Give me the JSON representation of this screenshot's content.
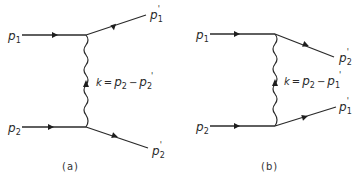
{
  "diagrams": [
    {
      "id": "a",
      "caption": "(a)",
      "incoming_top": {
        "symbol": "p",
        "sub": "1",
        "prime": ""
      },
      "incoming_bottom": {
        "symbol": "p",
        "sub": "2",
        "prime": ""
      },
      "outgoing_top": {
        "symbol": "p",
        "sub": "1",
        "prime": "'"
      },
      "outgoing_bottom": {
        "symbol": "p",
        "sub": "2",
        "prime": "'"
      },
      "exchange": {
        "k": "k",
        "eq": "=",
        "p": "p",
        "s1": "2",
        "minus": "−",
        "p2": "p",
        "s2": "2",
        "prime": "'"
      }
    },
    {
      "id": "b",
      "caption": "(b)",
      "incoming_top": {
        "symbol": "p",
        "sub": "1",
        "prime": ""
      },
      "incoming_bottom": {
        "symbol": "p",
        "sub": "2",
        "prime": ""
      },
      "outgoing_top": {
        "symbol": "p",
        "sub": "2",
        "prime": "'"
      },
      "outgoing_bottom": {
        "symbol": "p",
        "sub": "1",
        "prime": "'"
      },
      "exchange": {
        "k": "k",
        "eq": "=",
        "p": "p",
        "s1": "2",
        "minus": "−",
        "p2": "p",
        "s2": "1",
        "prime": "'"
      }
    }
  ]
}
